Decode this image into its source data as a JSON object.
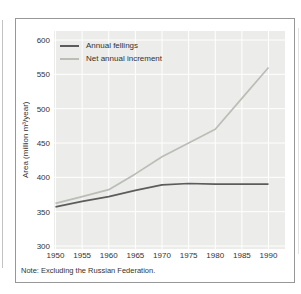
{
  "note": {
    "text": "Note: Excluding the Russian Federation."
  },
  "chart_data": {
    "type": "line",
    "x": [
      1950,
      1955,
      1960,
      1965,
      1970,
      1975,
      1980,
      1985,
      1990
    ],
    "series": [
      {
        "name": "Annual fellings",
        "color": "#5c5c5c",
        "values": [
          357,
          365,
          372,
          381,
          389,
          391,
          390,
          390,
          390
        ]
      },
      {
        "name": "Net annual increment",
        "color": "#babeb6",
        "values": [
          362,
          372,
          382,
          405,
          430,
          450,
          470,
          515,
          560
        ]
      }
    ],
    "title": "",
    "xlabel": "",
    "ylabel": "Area (million m³/year)",
    "ylim": [
      300,
      600
    ],
    "yticks": [
      600,
      550,
      500,
      450,
      400,
      350,
      300
    ],
    "xticks": [
      1950,
      1955,
      1960,
      1965,
      1970,
      1975,
      1980,
      1985,
      1990
    ],
    "grid": true,
    "grid_color": "#ffffff",
    "plot_bg": "#ececea",
    "legend_position": "top-left"
  }
}
